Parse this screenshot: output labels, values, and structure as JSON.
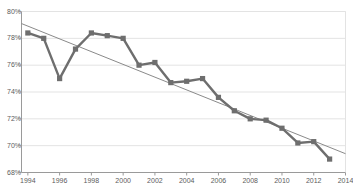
{
  "chart_data": {
    "type": "line",
    "title": "",
    "xlabel": "",
    "ylabel": "",
    "x": [
      1994,
      1995,
      1996,
      1997,
      1998,
      1999,
      2000,
      2001,
      2002,
      2003,
      2004,
      2005,
      2006,
      2007,
      2008,
      2009,
      2010,
      2011,
      2012,
      2013
    ],
    "values": [
      78.4,
      78.0,
      75.0,
      77.2,
      78.4,
      78.2,
      78.0,
      76.0,
      76.2,
      74.7,
      74.8,
      75.0,
      73.6,
      72.6,
      72.0,
      71.9,
      71.3,
      70.2,
      70.3,
      69.0
    ],
    "series": [
      {
        "name": "series-1",
        "marker": "square",
        "color": "#6e6e6e",
        "values": [
          78.4,
          78.0,
          75.0,
          77.2,
          78.4,
          78.2,
          78.0,
          76.0,
          76.2,
          74.7,
          74.8,
          75.0,
          73.6,
          72.6,
          72.0,
          71.9,
          71.3,
          70.2,
          70.3,
          69.0
        ]
      },
      {
        "name": "linear-trendline",
        "marker": "none",
        "color": "#8a8a8a",
        "x_endpoints": [
          1993.6,
          2014.0
        ],
        "y_endpoints": [
          79.1,
          69.4
        ]
      }
    ],
    "xlim": [
      1993.6,
      2014.0
    ],
    "ylim": [
      68,
      80
    ],
    "ytick_values": [
      80,
      78,
      76,
      74,
      72,
      70,
      68
    ],
    "ytick_labels": [
      "80%",
      "78%",
      "76%",
      "74%",
      "72%",
      "70%",
      "68%"
    ],
    "xtick_values": [
      1994,
      1996,
      1998,
      2000,
      2002,
      2004,
      2006,
      2008,
      2010,
      2012,
      2014
    ],
    "xtick_labels": [
      "1994",
      "1996",
      "1998",
      "2000",
      "2002",
      "2004",
      "2006",
      "2008",
      "2010",
      "2012",
      "2014"
    ],
    "grid": "horizontal",
    "grid_color": "#e3e3e3",
    "axis_color": "#9a9a9a",
    "plot_background": "#ffffff",
    "legend": "none"
  }
}
